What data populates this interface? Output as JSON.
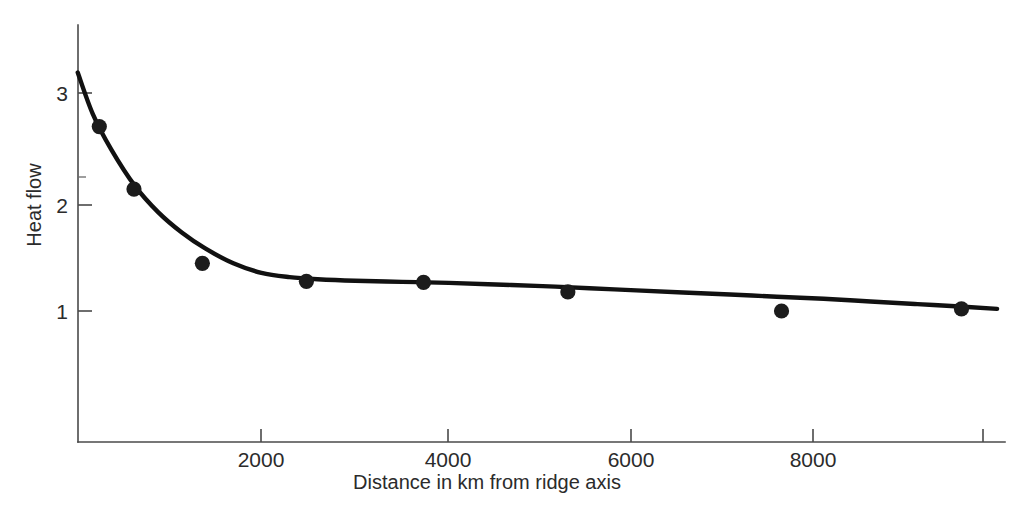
{
  "chart_data": {
    "type": "scatter",
    "title": "",
    "subtitle": "",
    "xlabel": "Distance in km from ridge axis",
    "ylabel": "Heat flow",
    "xlim": [
      0,
      10000
    ],
    "ylim": [
      0,
      3.45
    ],
    "grid": false,
    "legend": null,
    "legend_position": "none",
    "x_ticks": [
      {
        "value": 2000,
        "label": "2000"
      },
      {
        "value": 4000,
        "label": "4000"
      },
      {
        "value": 6000,
        "label": "6000"
      },
      {
        "value": 8000,
        "label": "8000"
      },
      {
        "value": 9700,
        "label": ""
      }
    ],
    "y_ticks": [
      {
        "value": 1,
        "label": "1"
      },
      {
        "value": 2,
        "label": "2"
      },
      {
        "value": 3,
        "label": "3"
      }
    ],
    "y_minor_ticks": [
      2.6
    ],
    "points": [
      {
        "x": 270,
        "y": 2.74
      },
      {
        "x": 640,
        "y": 2.15
      },
      {
        "x": 1370,
        "y": 1.45
      },
      {
        "x": 2480,
        "y": 1.28
      },
      {
        "x": 3730,
        "y": 1.27
      },
      {
        "x": 5270,
        "y": 1.18
      },
      {
        "x": 7550,
        "y": 1.0
      },
      {
        "x": 9470,
        "y": 1.02
      }
    ],
    "fit_curve": {
      "name": "model fit",
      "description": "decaying heat-flow model curve through the data",
      "x": [
        40,
        200,
        400,
        650,
        900,
        1150,
        1400,
        1700,
        2000,
        2300,
        2600,
        3000,
        3500,
        4000,
        4500,
        5000,
        5500,
        6000,
        6500,
        7000,
        7500,
        8000,
        8500,
        9000,
        9500,
        9850
      ],
      "y": [
        3.25,
        2.86,
        2.52,
        2.18,
        1.93,
        1.74,
        1.59,
        1.45,
        1.36,
        1.32,
        1.3,
        1.285,
        1.275,
        1.265,
        1.25,
        1.235,
        1.215,
        1.195,
        1.175,
        1.155,
        1.135,
        1.115,
        1.09,
        1.065,
        1.04,
        1.02
      ]
    }
  },
  "colors": {
    "background": "#ffffff",
    "axis": "#4a4a4a",
    "curve": "#111111",
    "marker": "#1c1c1c",
    "text": "#2b2b2b"
  }
}
